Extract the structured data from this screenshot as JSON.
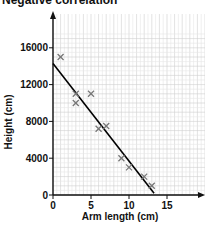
{
  "chart_data": {
    "type": "scatter",
    "title": "Negative correlation",
    "xlabel": "Arm length (cm)",
    "ylabel": "Height (cm)",
    "xlim": [
      0,
      20
    ],
    "ylim": [
      0,
      17500
    ],
    "x_ticks": [
      0,
      5,
      10,
      15
    ],
    "y_ticks": [
      0,
      4000,
      8000,
      12000,
      16000
    ],
    "grid": true,
    "series": [
      {
        "name": "data",
        "marker": "x",
        "color": "#777777",
        "points": [
          {
            "x": 1,
            "y": 15000
          },
          {
            "x": 3,
            "y": 11000
          },
          {
            "x": 3,
            "y": 10000
          },
          {
            "x": 5,
            "y": 11000
          },
          {
            "x": 6,
            "y": 7200
          },
          {
            "x": 7,
            "y": 7500
          },
          {
            "x": 9,
            "y": 4000
          },
          {
            "x": 10,
            "y": 3000
          },
          {
            "x": 12,
            "y": 2000
          },
          {
            "x": 13,
            "y": 1000
          }
        ]
      }
    ],
    "trend_line": {
      "color": "#000000",
      "from": {
        "x": 0,
        "y": 14300
      },
      "to": {
        "x": 13.3,
        "y": 200
      }
    }
  }
}
